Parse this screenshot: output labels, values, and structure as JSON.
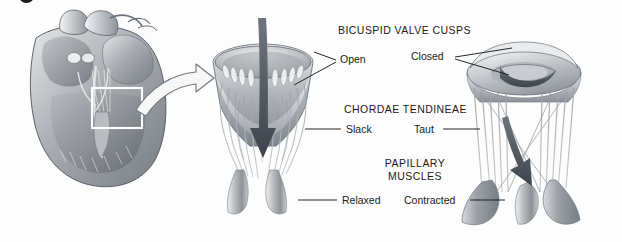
{
  "figure": {
    "title_alt": "Bicuspid (mitral) valve function during ventricular filling and contraction",
    "background_color": "#fdfdfd",
    "ink_color": "#1a1a1a",
    "style": "grayscale anatomical illustration"
  },
  "corner_marker": {
    "name": "figure-part-badge",
    "color": "#15181c",
    "shape": "circle-clipped-top"
  },
  "panels": [
    {
      "id": "heart-section",
      "name": "heart-cross-section",
      "caption_alt": "Coronal section of the heart with inset box over the left atrioventricular valve",
      "inset_box": true
    },
    {
      "id": "valve-open",
      "name": "open-valve-diagram",
      "caption_alt": "Bicuspid valve open, blood flowing down into ventricle",
      "flow_arrow": "straight-down",
      "arrow_color": "#4d545c"
    },
    {
      "id": "valve-closed",
      "name": "closed-valve-diagram",
      "caption_alt": "Bicuspid valve closed, cusps ballooned upward",
      "flow_arrow": "curved-down",
      "arrow_color": "#4d545c"
    }
  ],
  "connector": {
    "name": "magnify-connector-arrow",
    "direction": "right",
    "style": "hollow-outlined"
  },
  "labels": {
    "cusps": {
      "heading": "BICUSPID VALVE CUSPS",
      "left": "Open",
      "right": "Closed"
    },
    "chordae": {
      "heading": "CHORDAE TENDINEAE",
      "left": "Slack",
      "right": "Taut"
    },
    "papillary": {
      "heading_line1": "PAPILLARY",
      "heading_line2": "MUSCLES",
      "left": "Relaxed",
      "right": "Contracted"
    }
  }
}
